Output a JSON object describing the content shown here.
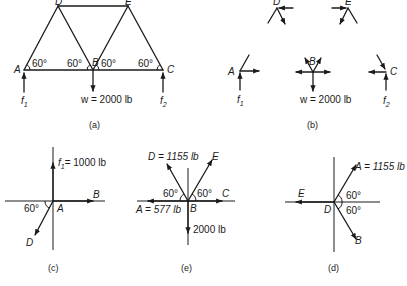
{
  "figure_a": {
    "caption": "(a)",
    "nodes": {
      "A": "A",
      "B": "B",
      "C": "C",
      "D": "D",
      "E": "E"
    },
    "angles": [
      "60°",
      "60°",
      "60°",
      "60°"
    ],
    "loads": {
      "f1": "f",
      "f1_sub": "1",
      "f2": "f",
      "f2_sub": "2",
      "w": "w = 2000 lb"
    }
  },
  "figure_b": {
    "caption": "(b)",
    "nodes": {
      "A": "A",
      "B": "B",
      "C": "C",
      "D": "D",
      "E": "E"
    },
    "loads": {
      "f1": "f",
      "f1_sub": "1",
      "f2": "f",
      "f2_sub": "2",
      "w": "w = 2000 lb"
    }
  },
  "figure_c": {
    "caption": "(c)",
    "origin": "A",
    "labels": {
      "f1": "f",
      "f1_sub": "1",
      "f1_value": "= 1000 lb",
      "B": "B",
      "D": "D"
    },
    "angle": "60°"
  },
  "figure_e": {
    "caption": "(e)",
    "origin": "B",
    "labels": {
      "D": "D = 1155 lb",
      "E": "E",
      "C": "C",
      "A": "A = 577 lb",
      "down": "2000 lb"
    },
    "angles": [
      "60°",
      "60°"
    ]
  },
  "figure_d": {
    "caption": "(d)",
    "origin": "D",
    "labels": {
      "A": "A = 1155 lb",
      "E": "E",
      "B": "B"
    },
    "angles": [
      "60°",
      "60°"
    ]
  }
}
